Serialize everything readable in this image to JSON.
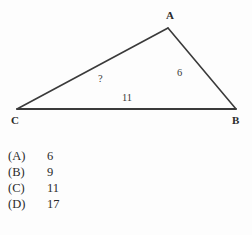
{
  "figure": {
    "type": "triangle-diagram",
    "background_color": "#fdfdfd",
    "stroke_color": "#3a3a3a",
    "vertices": [
      {
        "name": "A",
        "label": "A",
        "x": 168,
        "y": 28,
        "label_x": 166,
        "label_y": 19
      },
      {
        "name": "B",
        "label": "B",
        "x": 236,
        "y": 109,
        "label_x": 232,
        "label_y": 124
      },
      {
        "name": "C",
        "label": "C",
        "x": 17,
        "y": 109,
        "label_x": 11,
        "label_y": 124
      }
    ],
    "edges": [
      {
        "name": "edge-CA",
        "from": "C",
        "to": "A",
        "label": "?",
        "label_x": 98,
        "label_y": 82
      },
      {
        "name": "edge-AB",
        "from": "A",
        "to": "B",
        "label": "6",
        "label_x": 177,
        "label_y": 76
      },
      {
        "name": "edge-CB",
        "from": "C",
        "to": "B",
        "label": "11",
        "label_x": 122,
        "label_y": 101
      }
    ]
  },
  "choices": [
    {
      "key": "(A)",
      "value": "6"
    },
    {
      "key": "(B)",
      "value": "9"
    },
    {
      "key": "(C)",
      "value": "11"
    },
    {
      "key": "(D)",
      "value": "17"
    }
  ]
}
